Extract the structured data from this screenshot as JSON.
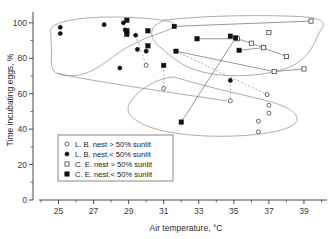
{
  "chart_data": {
    "type": "scatter",
    "title": "",
    "xlabel": "Air temperature, °C",
    "ylabel": "Time incubating eggs, %",
    "xlim": [
      24.0,
      40.2
    ],
    "ylim": [
      0,
      105
    ],
    "grid": false,
    "legend_position": "lower-left-inside",
    "x_ticks": [
      "25",
      "27",
      "29",
      "31",
      "33",
      "35",
      "37",
      "39"
    ],
    "x_tick_values": [
      25,
      27,
      29,
      31,
      33,
      35,
      37,
      39
    ],
    "x_minor_step": 1,
    "y_ticks": [
      "0",
      "20",
      "40",
      "60",
      "80",
      "100"
    ],
    "y_tick_values": [
      0,
      20,
      40,
      60,
      80,
      100
    ],
    "y_minor_step": 10,
    "series": [
      {
        "name": "L. B. nest > 50% sunlit",
        "marker": "open-circle",
        "points": [
          [
            30.0,
            76.0
          ],
          [
            31.0,
            63.0
          ],
          [
            34.8,
            56.0
          ],
          [
            36.9,
            59.5
          ],
          [
            37.0,
            53.5
          ],
          [
            37.0,
            49.0
          ],
          [
            36.4,
            44.5
          ],
          [
            36.4,
            38.5
          ]
        ]
      },
      {
        "name": "L. B. nest < 50% sunlit",
        "marker": "filled-circle",
        "points": [
          [
            25.1,
            97.5
          ],
          [
            25.1,
            94.0
          ],
          [
            27.6,
            99.0
          ],
          [
            28.7,
            100.0
          ],
          [
            28.8,
            96.0
          ],
          [
            29.4,
            93.0
          ],
          [
            29.5,
            85.0
          ],
          [
            30.0,
            84.0
          ],
          [
            28.5,
            74.5
          ],
          [
            34.8,
            67.5
          ]
        ]
      },
      {
        "name": "C. E. nest > 50% sunlit",
        "marker": "open-square",
        "points": [
          [
            35.2,
            91.0
          ],
          [
            36.0,
            88.5
          ],
          [
            37.0,
            94.5
          ],
          [
            36.7,
            86.0
          ],
          [
            38.0,
            81.0
          ],
          [
            39.4,
            101.0
          ],
          [
            37.3,
            72.5
          ],
          [
            39.0,
            74.0
          ]
        ]
      },
      {
        "name": "C. E. nest < 50% sunlit",
        "marker": "filled-square",
        "points": [
          [
            28.9,
            101.5
          ],
          [
            28.9,
            95.5
          ],
          [
            28.9,
            93.5
          ],
          [
            30.1,
            95.5
          ],
          [
            30.1,
            87.0
          ],
          [
            31.6,
            98.0
          ],
          [
            31.7,
            84.0
          ],
          [
            31.0,
            76.0
          ],
          [
            32.9,
            91.0
          ],
          [
            34.8,
            92.5
          ],
          [
            35.3,
            84.5
          ],
          [
            32.0,
            44.0
          ],
          [
            35.1,
            91.5
          ]
        ]
      }
    ],
    "connectors": [
      {
        "style": "solid",
        "from": [
          31.6,
          98.0
        ],
        "to": [
          39.4,
          101.0
        ]
      },
      {
        "style": "solid",
        "from": [
          32.9,
          91.0
        ],
        "to": [
          35.2,
          91.0
        ]
      },
      {
        "style": "solid",
        "from": [
          35.2,
          91.0
        ],
        "to": [
          36.0,
          88.5
        ]
      },
      {
        "style": "solid",
        "from": [
          35.3,
          84.5
        ],
        "to": [
          36.7,
          86.0
        ]
      },
      {
        "style": "solid",
        "from": [
          36.0,
          88.5
        ],
        "to": [
          38.0,
          81.0
        ]
      },
      {
        "style": "solid",
        "from": [
          31.7,
          84.0
        ],
        "to": [
          37.3,
          72.5
        ]
      },
      {
        "style": "solid",
        "from": [
          37.3,
          72.5
        ],
        "to": [
          39.0,
          74.0
        ]
      },
      {
        "style": "solid",
        "from": [
          32.0,
          44.0
        ],
        "to": [
          35.1,
          91.5
        ]
      },
      {
        "style": "dashed",
        "from": [
          29.4,
          93.0
        ],
        "to": [
          30.0,
          76.0
        ]
      },
      {
        "style": "dashed",
        "from": [
          31.0,
          76.0
        ],
        "to": [
          31.0,
          63.0
        ]
      },
      {
        "style": "dashed",
        "from": [
          34.8,
          67.5
        ],
        "to": [
          34.8,
          56.0
        ]
      },
      {
        "style": "dashed",
        "from": [
          31.7,
          84.0
        ],
        "to": [
          36.9,
          59.5
        ]
      }
    ],
    "hulls": [
      {
        "name": "left-group-outline",
        "path": "M 24.55,95.0 C 24.45,99.5 25.6,102.6 27.4,103.2 C 29.1,103.7 30.6,102.2 31.2,101.0 C 31.9,99.5 31.6,97.0 31.0,95.0 C 30.2,92.4 29.4,89.0 28.7,85.0 C 28.0,80.7 27.6,76.2 26.9,73.0 C 26.2,69.6 25.4,69.3 24.9,71.6 C 24.5,73.6 24.6,78.0 24.6,83.0 Z"
      },
      {
        "name": "upper-right-group-outline",
        "path": "M 31.0,101.5 C 33.2,104.2 36.5,104.6 38.7,103.6 C 40.0,102.9 40.3,100.3 40.0,96.5 C 39.7,92.5 39.6,85.5 38.9,79.5 C 38.4,74.7 37.2,70.8 35.5,70.2 C 34.2,69.7 33.0,72.0 32.3,75.5 C 31.6,79.0 31.0,84.5 30.6,88.0 C 30.3,90.9 30.2,95.5 30.5,98.5 Z"
      },
      {
        "name": "lower-right-group-outline",
        "path": "M 31.6,69.5 C 33.0,65.0 35.0,60.5 36.5,57.0 C 37.8,54.0 38.5,50.5 38.6,46.5 C 38.7,42.0 37.8,38.5 36.1,36.8 C 34.4,35.2 32.5,36.0 31.2,38.5 C 30.0,41.0 29.2,45.0 29.0,49.5 C 28.8,54.0 29.4,60.0 30.1,64.5 C 30.5,67.0 31.0,69.0 31.6,69.5 Z"
      },
      {
        "name": "left-lower-sweep-outline",
        "path": "M 24.9,71.6 C 26.0,69.0 27.6,66.5 29.2,64.0 C 31.0,61.2 32.8,58.5 34.6,56.0"
      }
    ],
    "legend_entries": [
      {
        "marker": "open-circle",
        "label": "L. B. nest > 50% sunlit"
      },
      {
        "marker": "filled-circle",
        "label": "L. B. nest.< 50% sunlit"
      },
      {
        "marker": "open-square",
        "label": "C. E. nest > 50% sunlit"
      },
      {
        "marker": "filled-square",
        "label": "C. E. nest.< 50% sunlit"
      }
    ],
    "colors": {
      "axis": "#4a4a4a",
      "marker_fill": "#111111",
      "marker_open": "#ffffff",
      "hull": "#8a8a8a",
      "connector": "#6a6a6a",
      "background": "#ffffff"
    }
  }
}
